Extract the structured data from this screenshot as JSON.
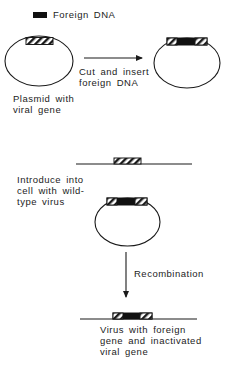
{
  "legend": {
    "swatch_color": "#111111",
    "label": "Foreign DNA"
  },
  "steps": {
    "plasmid_original": {
      "caption_lines": [
        "Plasmid with",
        "viral gene"
      ],
      "insert": "viral-gene-hatched"
    },
    "cut_insert": {
      "arrow_direction": "right",
      "caption_lines": [
        "Cut and insert",
        "foreign DNA"
      ]
    },
    "plasmid_recombinant": {
      "insert": "hatched-foreign-hatched"
    },
    "introduce": {
      "caption_lines": [
        "Introduce into",
        "cell with wild-",
        "type virus"
      ]
    },
    "recombination": {
      "arrow_direction": "down",
      "label": "Recombination"
    },
    "result": {
      "caption_lines": [
        "Virus with foreign",
        "gene and inactivated",
        "viral gene"
      ]
    }
  },
  "colors": {
    "line": "#1a1a1a",
    "foreign_dna": "#111111",
    "background": "#ffffff"
  }
}
